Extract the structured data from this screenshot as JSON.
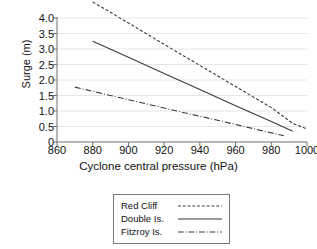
{
  "chart_data": {
    "type": "line",
    "title": "",
    "xlabel": "Cyclone central pressure (hPa)",
    "ylabel": "Surge (m)",
    "xlim": [
      860,
      1000
    ],
    "ylim": [
      0,
      4.0
    ],
    "xticks": [
      860,
      880,
      900,
      920,
      940,
      960,
      980,
      1000
    ],
    "xtick_labels": [
      "860",
      "880",
      "900",
      "920",
      "940",
      "960",
      "980",
      "1000"
    ],
    "yticks": [
      0,
      0.5,
      1.0,
      1.5,
      2.0,
      2.5,
      3.0,
      3.5,
      4.0
    ],
    "ytick_labels": [
      "0",
      "0.5",
      "1.0",
      "1.5",
      "2.0",
      "2.5",
      "3.0",
      "3.5",
      "4.0"
    ],
    "grid": "horizontal",
    "legend_position": "below-center",
    "line_color": "#3a3a3a",
    "axis_color": "#6e6e6e",
    "grid_color": "#e6e6e6",
    "series": [
      {
        "name": "Red Cliff",
        "style": "dashed",
        "dasharray": "3,2",
        "x": [
          880,
          1000
        ],
        "y": [
          4.52,
          0.42
        ],
        "points": [
          {
            "x": 880,
            "y": 4.52
          },
          {
            "x": 900,
            "y": 3.84
          },
          {
            "x": 920,
            "y": 3.15
          },
          {
            "x": 940,
            "y": 2.47
          },
          {
            "x": 960,
            "y": 1.79
          },
          {
            "x": 980,
            "y": 1.11
          },
          {
            "x": 992,
            "y": 0.6
          },
          {
            "x": 1000,
            "y": 0.42
          }
        ]
      },
      {
        "name": "Double Is.",
        "style": "solid",
        "dasharray": "none",
        "x": [
          880,
          992
        ],
        "y": [
          3.25,
          0.35
        ],
        "points": [
          {
            "x": 880,
            "y": 3.25
          },
          {
            "x": 900,
            "y": 2.73
          },
          {
            "x": 920,
            "y": 2.21
          },
          {
            "x": 940,
            "y": 1.69
          },
          {
            "x": 960,
            "y": 1.17
          },
          {
            "x": 980,
            "y": 0.66
          },
          {
            "x": 992,
            "y": 0.35
          }
        ]
      },
      {
        "name": "Fitzroy Is.",
        "style": "dash-dot",
        "dasharray": "6,2,1,2",
        "x": [
          870,
          987
        ],
        "y": [
          1.77,
          0.2
        ],
        "points": [
          {
            "x": 870,
            "y": 1.77
          },
          {
            "x": 890,
            "y": 1.5
          },
          {
            "x": 910,
            "y": 1.23
          },
          {
            "x": 930,
            "y": 0.96
          },
          {
            "x": 950,
            "y": 0.7
          },
          {
            "x": 970,
            "y": 0.43
          },
          {
            "x": 987,
            "y": 0.2
          }
        ]
      }
    ]
  },
  "legend": {
    "entries": [
      {
        "label": "Red Cliff"
      },
      {
        "label": "Double Is."
      },
      {
        "label": "Fitzroy Is."
      }
    ]
  }
}
